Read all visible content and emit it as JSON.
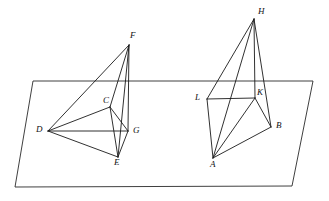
{
  "figure": {
    "background_color": "#ffffff",
    "stroke_color": "#1a1a1a",
    "label_color": "#111111",
    "width": 329,
    "height": 201
  },
  "plane": {
    "name": "cutting-plane",
    "shape": "parallelogram",
    "corners": [
      {
        "label": "top-left",
        "x": 33,
        "y": 81
      },
      {
        "label": "top-right",
        "x": 313,
        "y": 81
      },
      {
        "label": "bottom-right",
        "x": 292,
        "y": 186
      },
      {
        "label": "bottom-left",
        "x": 15,
        "y": 187
      }
    ]
  },
  "solids": [
    {
      "name": "left-tetrahedron",
      "apex": "F",
      "vertices": [
        {
          "id": "F",
          "label": "F",
          "x": 129,
          "y": 45,
          "label_x": 130,
          "label_y": 31
        },
        {
          "id": "C",
          "label": "C",
          "x": 110,
          "y": 107,
          "label_x": 103,
          "label_y": 96
        },
        {
          "id": "D",
          "label": "D",
          "x": 48,
          "y": 131,
          "label_x": 36,
          "label_y": 125
        },
        {
          "id": "G",
          "label": "G",
          "x": 128,
          "y": 131,
          "label_x": 133,
          "label_y": 126
        },
        {
          "id": "E",
          "label": "E",
          "x": 118,
          "y": 157,
          "label_x": 114,
          "label_y": 158
        }
      ],
      "edges": [
        {
          "from": "F",
          "to": "D"
        },
        {
          "from": "F",
          "to": "C"
        },
        {
          "from": "F",
          "to": "G"
        },
        {
          "from": "F",
          "to": "E"
        },
        {
          "from": "D",
          "to": "C"
        },
        {
          "from": "D",
          "to": "G"
        },
        {
          "from": "D",
          "to": "E"
        },
        {
          "from": "C",
          "to": "G"
        },
        {
          "from": "C",
          "to": "E"
        },
        {
          "from": "G",
          "to": "E"
        }
      ]
    },
    {
      "name": "right-tetrahedron",
      "apex": "H",
      "vertices": [
        {
          "id": "H",
          "label": "H",
          "x": 254,
          "y": 19,
          "label_x": 258,
          "label_y": 7
        },
        {
          "id": "L",
          "label": "L",
          "x": 207,
          "y": 99,
          "label_x": 195,
          "label_y": 93
        },
        {
          "id": "K",
          "label": "K",
          "x": 255,
          "y": 98,
          "label_x": 257,
          "label_y": 88
        },
        {
          "id": "B",
          "label": "B",
          "x": 271,
          "y": 127,
          "label_x": 276,
          "label_y": 121
        },
        {
          "id": "A",
          "label": "A",
          "x": 213,
          "y": 158,
          "label_x": 210,
          "label_y": 160
        }
      ],
      "edges": [
        {
          "from": "H",
          "to": "L"
        },
        {
          "from": "H",
          "to": "K"
        },
        {
          "from": "H",
          "to": "A"
        },
        {
          "from": "H",
          "to": "B"
        },
        {
          "from": "L",
          "to": "K"
        },
        {
          "from": "L",
          "to": "A"
        },
        {
          "from": "K",
          "to": "A"
        },
        {
          "from": "K",
          "to": "B"
        },
        {
          "from": "A",
          "to": "B"
        }
      ]
    }
  ],
  "labels": [
    {
      "id": "F",
      "text": "F"
    },
    {
      "id": "C",
      "text": "C"
    },
    {
      "id": "D",
      "text": "D"
    },
    {
      "id": "G",
      "text": "G"
    },
    {
      "id": "E",
      "text": "E"
    },
    {
      "id": "H",
      "text": "H"
    },
    {
      "id": "L",
      "text": "L"
    },
    {
      "id": "K",
      "text": "K"
    },
    {
      "id": "B",
      "text": "B"
    },
    {
      "id": "A",
      "text": "A"
    }
  ]
}
